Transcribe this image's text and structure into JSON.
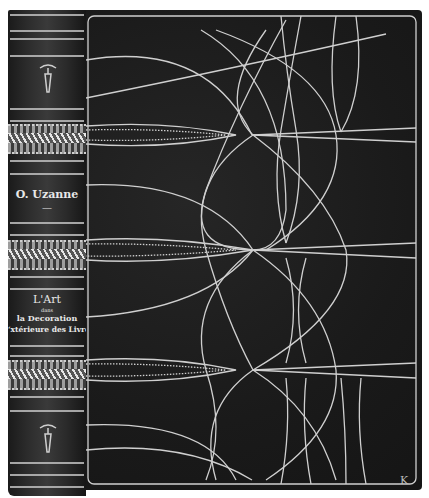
{
  "image": {
    "subject": "Decorated book binding, spine and front cover",
    "colors": {
      "leather": "#1c1c1c",
      "gilt_line": "#d0d0d0",
      "background": "#ffffff"
    }
  },
  "spine": {
    "author": "O. Uzanne",
    "separator": "—",
    "title_lines": [
      "L'Art",
      "dans",
      "la Decoration",
      "‘xtérieure des Livre"
    ],
    "ornaments": [
      "tool-ornament-icon",
      "wheat-band",
      "wheat-band",
      "wheat-band",
      "tool-ornament-icon"
    ]
  },
  "cover": {
    "monogram": "K",
    "pattern": "curvilinear-gilt-lines",
    "wheat_lozenges": 3
  }
}
